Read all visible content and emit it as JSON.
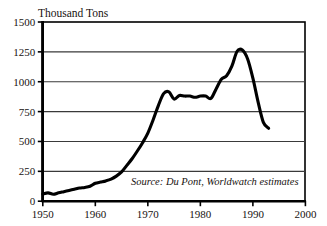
{
  "chart_data": {
    "type": "line",
    "title": "Thousand Tons",
    "xlabel": "",
    "ylabel": "Thousand Tons",
    "xlim": [
      1950,
      2000
    ],
    "ylim": [
      0,
      1500
    ],
    "grid": true,
    "legend": "none",
    "annotation": "Source: Du Pont, Worldwatch estimates",
    "x_ticks": [
      1950,
      1960,
      1970,
      1980,
      1990,
      2000
    ],
    "x_tick_labels": [
      "1950",
      "1960",
      "1970",
      "1980",
      "1990",
      "2000"
    ],
    "y_ticks": [
      0,
      250,
      500,
      750,
      1000,
      1250,
      1500
    ],
    "y_tick_labels": [
      "0",
      "250",
      "500",
      "750",
      "1000",
      "1250",
      "1500"
    ],
    "series": [
      {
        "name": "CFC production",
        "color": "#000000",
        "x": [
          1950,
          1951,
          1952,
          1953,
          1954,
          1955,
          1956,
          1957,
          1958,
          1959,
          1960,
          1961,
          1962,
          1963,
          1964,
          1965,
          1966,
          1967,
          1968,
          1969,
          1970,
          1971,
          1972,
          1973,
          1974,
          1975,
          1976,
          1977,
          1978,
          1979,
          1980,
          1981,
          1982,
          1983,
          1984,
          1985,
          1986,
          1987,
          1988,
          1989,
          1990,
          1991,
          1992,
          1993
        ],
        "values": [
          60,
          70,
          58,
          70,
          80,
          90,
          100,
          110,
          115,
          125,
          150,
          160,
          170,
          185,
          210,
          245,
          300,
          355,
          420,
          490,
          570,
          680,
          800,
          900,
          915,
          855,
          885,
          880,
          880,
          870,
          880,
          880,
          860,
          940,
          1020,
          1050,
          1130,
          1255,
          1265,
          1190,
          1030,
          830,
          660,
          610
        ]
      }
    ]
  },
  "axis_title": "Thousand Tons",
  "source_text": "Source: Du Pont, Worldwatch estimates",
  "colors": {
    "line": "#000000",
    "grid": "#3a3a3a",
    "frame": "#000000",
    "text": "#17120f",
    "background": "#ffffff"
  }
}
